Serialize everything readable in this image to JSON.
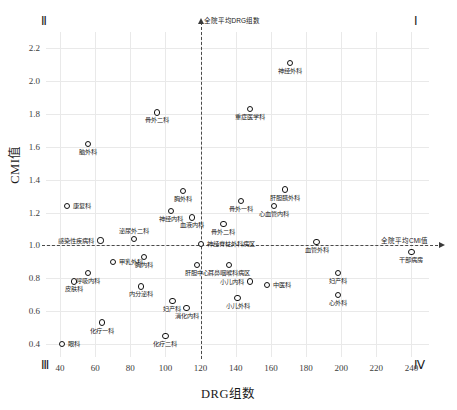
{
  "chart_data": {
    "type": "scatter",
    "title": "",
    "xlabel": "DRG组数",
    "ylabel": "CMI值",
    "xlim": [
      32,
      250
    ],
    "ylim": [
      0.32,
      2.3
    ],
    "xticks": [
      40,
      60,
      80,
      100,
      120,
      140,
      160,
      180,
      200,
      220,
      240
    ],
    "yticks": [
      0.4,
      0.6,
      0.8,
      1.0,
      1.2,
      1.4,
      1.6,
      1.8,
      2.0,
      2.2
    ],
    "grid": true,
    "legend": "none",
    "reference_lines": [
      {
        "axis": "vertical",
        "value": 120,
        "label": "全院平均DRG组数",
        "style": "dashed",
        "arrow": "up"
      },
      {
        "axis": "horizontal",
        "value": 1.0,
        "label": "全院平均CMI值",
        "style": "dashed",
        "arrow": "right"
      }
    ],
    "quadrant_labels": [
      {
        "name": "Ⅰ",
        "position": "top-right"
      },
      {
        "name": "Ⅱ",
        "position": "top-left"
      },
      {
        "name": "Ⅲ",
        "position": "bottom-left"
      },
      {
        "name": "Ⅳ",
        "position": "bottom-right"
      }
    ],
    "points": [
      {
        "label": "神经外科",
        "x": 171,
        "y": 2.11,
        "lp": "lb"
      },
      {
        "label": "重症医学科",
        "x": 148,
        "y": 1.83,
        "lp": "lb"
      },
      {
        "label": "骨外二科",
        "x": 95,
        "y": 1.81,
        "lp": "lb"
      },
      {
        "label": "脑外科",
        "x": 56,
        "y": 1.62,
        "lp": "lb"
      },
      {
        "label": "肝胆胰外科",
        "x": 168,
        "y": 1.34,
        "lp": "lb"
      },
      {
        "label": "胸外科",
        "x": 110,
        "y": 1.33,
        "lp": "lb"
      },
      {
        "label": "骨外一科",
        "x": 143,
        "y": 1.27,
        "lp": "lb"
      },
      {
        "label": "心血管内科",
        "x": 162,
        "y": 1.24,
        "lp": "lb"
      },
      {
        "label": "康复科",
        "x": 44,
        "y": 1.24,
        "lp": "lr"
      },
      {
        "label": "神经内科",
        "x": 103,
        "y": 1.21,
        "lp": "lb"
      },
      {
        "label": "血液内科",
        "x": 115,
        "y": 1.17,
        "lp": "lb"
      },
      {
        "label": "骨外二科",
        "x": 133,
        "y": 1.13,
        "lp": "lb"
      },
      {
        "label": "感染性疾病科",
        "x": 63,
        "y": 1.03,
        "lp": "ll"
      },
      {
        "label": "泌尿外二科",
        "x": 82,
        "y": 1.04,
        "lp": "lt"
      },
      {
        "label": "神经脊柱外科病区",
        "x": 120,
        "y": 1.01,
        "lp": "lr"
      },
      {
        "label": "血管外科",
        "x": 186,
        "y": 1.02,
        "lp": "lb"
      },
      {
        "label": "全院平均",
        "x": 240,
        "y": 0.96,
        "lp": "lb",
        "alias": "干部病房"
      },
      {
        "label": "胸内科",
        "x": 88,
        "y": 0.93,
        "lp": "lb"
      },
      {
        "label": "肝胆中心",
        "x": 118,
        "y": 0.88,
        "lp": "lb"
      },
      {
        "label": "耳鼻咽喉科病区",
        "x": 136,
        "y": 0.88,
        "lp": "lb"
      },
      {
        "label": "甲乳外科",
        "x": 70,
        "y": 0.9,
        "lp": "lr"
      },
      {
        "label": "呼吸内科",
        "x": 56,
        "y": 0.83,
        "lp": "lb"
      },
      {
        "label": "皮肤科",
        "x": 48,
        "y": 0.78,
        "lp": "lb"
      },
      {
        "label": "内分泌科",
        "x": 86,
        "y": 0.75,
        "lp": "lb"
      },
      {
        "label": "小儿内科",
        "x": 148,
        "y": 0.78,
        "lp": "ll"
      },
      {
        "label": "中医科",
        "x": 158,
        "y": 0.76,
        "lp": "lr"
      },
      {
        "label": "妇产科",
        "x": 198,
        "y": 0.83,
        "lp": "lb"
      },
      {
        "label": "心外科",
        "x": 198,
        "y": 0.7,
        "lp": "lb"
      },
      {
        "label": "小儿外科",
        "x": 141,
        "y": 0.68,
        "lp": "lb"
      },
      {
        "label": "妇产科",
        "x": 104,
        "y": 0.66,
        "lp": "lb"
      },
      {
        "label": "消化内科",
        "x": 112,
        "y": 0.62,
        "lp": "lb"
      },
      {
        "label": "化疗一科",
        "x": 64,
        "y": 0.53,
        "lp": "lb"
      },
      {
        "label": "化疗二科",
        "x": 100,
        "y": 0.45,
        "lp": "lb"
      },
      {
        "label": "眼科",
        "x": 41,
        "y": 0.4,
        "lp": "lr"
      }
    ]
  }
}
